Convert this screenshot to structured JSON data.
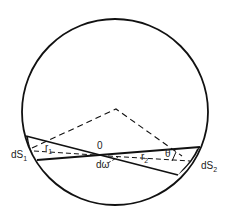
{
  "diagram": {
    "title": "",
    "labels": {
      "dS1": "dS",
      "dS1_sub": "1",
      "dS2": "dS",
      "dS2_sub": "2",
      "r1": "r",
      "r1_sub": "1",
      "r2": "r",
      "r2_sub": "2",
      "origin": "0",
      "solid_angle": "dω",
      "angle": "θ"
    },
    "colors": {
      "stroke": "#111111",
      "background": "#ffffff"
    }
  }
}
